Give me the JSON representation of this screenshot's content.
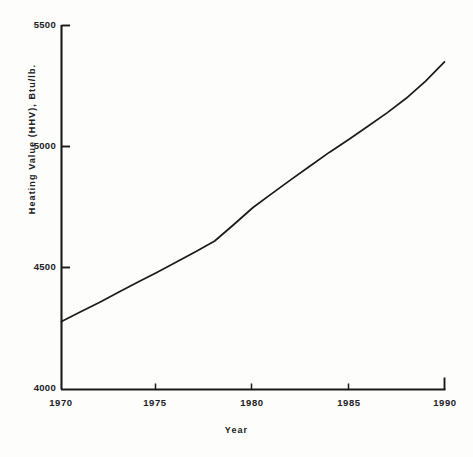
{
  "chart_data": {
    "type": "line",
    "title": "",
    "subtitle": "",
    "xlabel": "Year",
    "ylabel": "Heating  Value  (HHV),  Btu/lb.",
    "xlim": [
      1970,
      1990
    ],
    "ylim": [
      4000,
      5500
    ],
    "xticks": [
      1970,
      1975,
      1980,
      1985,
      1990
    ],
    "xtick_labels": [
      "1970",
      "1975",
      "1980",
      "1985",
      "1990"
    ],
    "yticks": [
      4000,
      4500,
      5000,
      5500
    ],
    "ytick_labels": [
      "4000",
      "4500",
      "5000",
      "5500"
    ],
    "grid": false,
    "legend": null,
    "annotations": [],
    "line_color": "#1a1a1a",
    "series": [
      {
        "name": "Heating Value (HHV)",
        "x": [
          1970,
          1971,
          1972,
          1973,
          1974,
          1975,
          1976,
          1977,
          1978,
          1979,
          1980,
          1981,
          1982,
          1983,
          1984,
          1985,
          1986,
          1987,
          1988,
          1989,
          1990
        ],
        "values": [
          4280,
          4320,
          4360,
          4402,
          4443,
          4483,
          4525,
          4568,
          4612,
          4680,
          4750,
          4808,
          4866,
          4922,
          4978,
          5030,
          5085,
          5140,
          5200,
          5270,
          5350
        ]
      }
    ]
  },
  "figure": {
    "background_color": "#fdfdfc",
    "axis_color": "#1a1a1a"
  }
}
